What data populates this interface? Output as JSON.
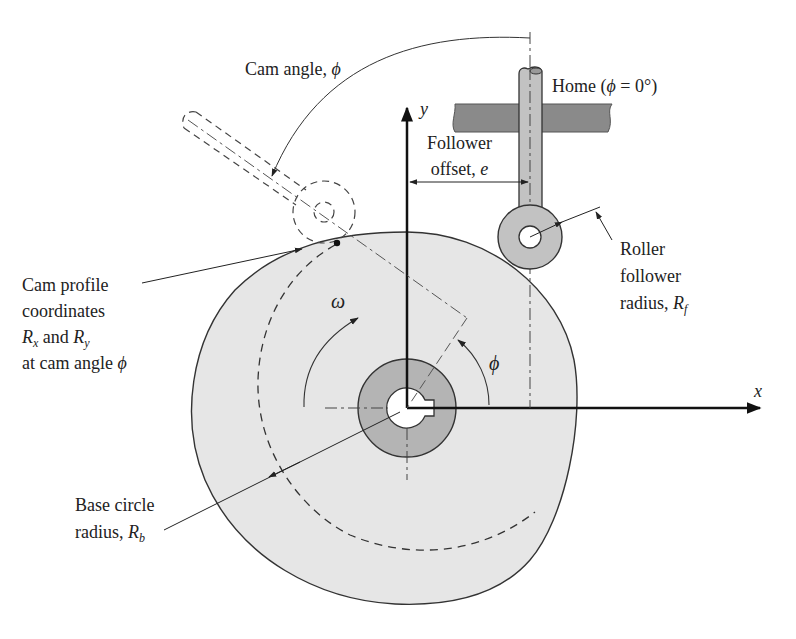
{
  "figure": {
    "type": "cam-follower diagram",
    "colors": {
      "cam_fill": "#e6e6e6",
      "hub_fill": "#b4b4b4",
      "follower_fill": "#c2c2c2",
      "guide_fill": "#8a8a8a",
      "line": "#222222"
    }
  },
  "labels": {
    "cam_angle": {
      "text": "Cam angle, ",
      "symbol": "ϕ"
    },
    "home": {
      "text_pre": "Home (",
      "symbol": "ϕ",
      "text_post": " = 0°)"
    },
    "y_axis": "y",
    "x_axis": "x",
    "follower_offset": {
      "line1": "Follower",
      "line2_pre": "offset, ",
      "symbol": "e"
    },
    "roller_radius": {
      "line1": "Roller",
      "line2": "follower",
      "line3_pre": "radius, ",
      "symbol": "R",
      "sub": "f"
    },
    "cam_profile": {
      "line1": "Cam profile",
      "line2": "coordinates",
      "line3_sym1": "R",
      "line3_sub1": "x",
      "line3_mid": " and ",
      "line3_sym2": "R",
      "line3_sub2": "y",
      "line4_pre": "at cam angle ",
      "line4_symbol": "ϕ"
    },
    "omega": "ω",
    "phi": "ϕ",
    "base_circle": {
      "line1": "Base circle",
      "line2_pre": "radius, ",
      "symbol": "R",
      "sub": "b"
    }
  }
}
